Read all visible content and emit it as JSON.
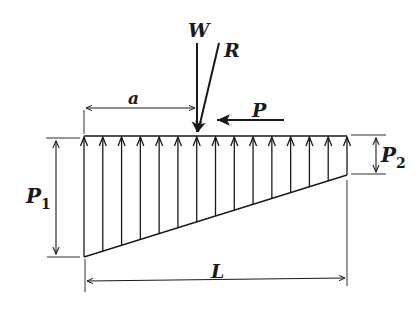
{
  "diagram": {
    "labels": {
      "W": "W",
      "R": "R",
      "P": "P",
      "a": "a",
      "L": "L",
      "P1_main": "P",
      "P1_sub": "1",
      "P2_main": "P",
      "P2_sub": "2"
    },
    "geometry": {
      "top_y": 136,
      "left_x": 84,
      "right_x": 347,
      "bottom_left_y": 257,
      "bottom_right_y": 175,
      "arrow_count": 15
    },
    "colors": {
      "ink": "#1a1a1a",
      "background": "#ffffff"
    }
  }
}
